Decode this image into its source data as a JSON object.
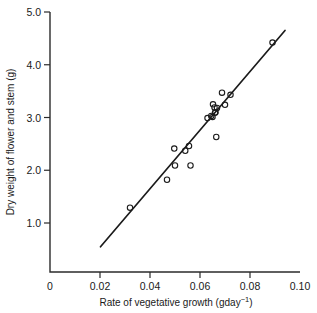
{
  "chart_data": {
    "type": "scatter",
    "title": "",
    "xlabel": "Rate of vegetative growth (gday⁻¹)",
    "xlabel_base": "Rate of vegetative growth (gday",
    "xlabel_exponent": "−1",
    "xlabel_tail": ")",
    "ylabel": "Dry weight of flower and stem (g)",
    "xlim": [
      0,
      0.1
    ],
    "ylim": [
      0,
      5.0
    ],
    "xticks": [
      0,
      0.02,
      0.04,
      0.06,
      0.08,
      0.1
    ],
    "xticklabels": [
      "0",
      "0.02",
      "0.04",
      "0.06",
      "0.08",
      "0.10"
    ],
    "yticks": [
      1.0,
      2.0,
      3.0,
      4.0,
      5.0
    ],
    "yticklabels": [
      "1.0",
      "2.0",
      "3.0",
      "4.0",
      "5.0"
    ],
    "grid": false,
    "legend": null,
    "marker": "open-circle",
    "marker_color": "#1b1b1b",
    "line_color": "#1b1b1b",
    "points": [
      {
        "x": 0.032,
        "y": 1.29
      },
      {
        "x": 0.0468,
        "y": 1.82
      },
      {
        "x": 0.0497,
        "y": 2.41
      },
      {
        "x": 0.05,
        "y": 2.09
      },
      {
        "x": 0.0541,
        "y": 2.37
      },
      {
        "x": 0.0556,
        "y": 2.46
      },
      {
        "x": 0.0562,
        "y": 2.09
      },
      {
        "x": 0.063,
        "y": 2.99
      },
      {
        "x": 0.0645,
        "y": 3.03
      },
      {
        "x": 0.065,
        "y": 3.01
      },
      {
        "x": 0.0652,
        "y": 3.25
      },
      {
        "x": 0.0658,
        "y": 3.19
      },
      {
        "x": 0.066,
        "y": 3.09
      },
      {
        "x": 0.0662,
        "y": 3.1
      },
      {
        "x": 0.0668,
        "y": 3.18
      },
      {
        "x": 0.0665,
        "y": 2.63
      },
      {
        "x": 0.0688,
        "y": 3.47
      },
      {
        "x": 0.07,
        "y": 3.24
      },
      {
        "x": 0.0722,
        "y": 3.43
      },
      {
        "x": 0.089,
        "y": 4.42
      }
    ],
    "fit_line": {
      "x1": 0.0202,
      "y1": 0.55,
      "x2": 0.094,
      "y2": 4.65,
      "style": "solid"
    }
  },
  "geometry": {
    "plot_left_px": 50,
    "plot_right_px": 300,
    "plot_bottom_px": 272,
    "y_zero_px": 275.75,
    "y_unit_px": 52.75,
    "x_unit_px": 2500
  }
}
